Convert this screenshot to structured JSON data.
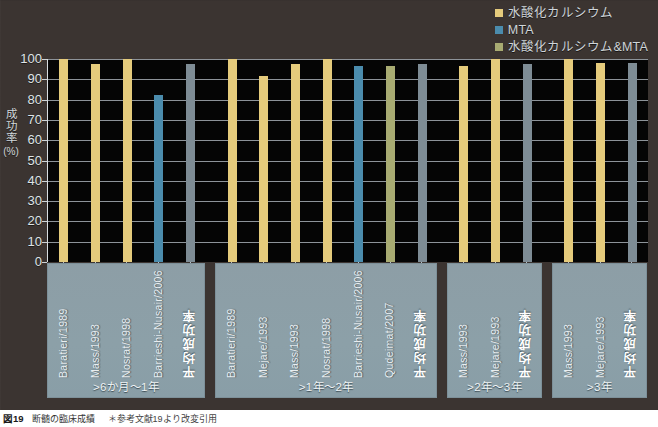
{
  "chart_data": {
    "type": "bar",
    "title": "",
    "xlabel": "",
    "ylabel": "成功率",
    "yunit": "(%)",
    "ylim": [
      0,
      100
    ],
    "yticks": [
      0,
      10,
      20,
      30,
      40,
      50,
      60,
      70,
      80,
      90,
      100
    ],
    "grid": true,
    "legend_position": "top-right",
    "legend": [
      {
        "label": "水酸化カルシウム",
        "color": "#e5cb7c",
        "key": "ca"
      },
      {
        "label": "MTA",
        "color": "#4b8cad",
        "key": "mta"
      },
      {
        "label": "水酸化カルシウム&MTA",
        "color": "#a8ab72",
        "key": "both"
      }
    ],
    "average_color": "#7e8c95",
    "groups": [
      {
        "header": ">6か月〜1年",
        "categories": [
          "Baratieri/1989",
          "Mass/1993",
          "Nosrat/1998",
          "Barrieshi-Nusair/2006",
          "平均成功率"
        ],
        "values": [
          100,
          97.5,
          100,
          82.5,
          97.5
        ],
        "series": [
          "ca",
          "ca",
          "ca",
          "mta",
          "avg"
        ]
      },
      {
        "header": ">1年〜2年",
        "categories": [
          "Baratieri/1989",
          "Mejare/1993",
          "Mass/1993",
          "Nosrat/1998",
          "Barrieshi-Nusair/2006",
          "Qudeimat/2007",
          "平均成功率"
        ],
        "values": [
          100,
          91.5,
          97.5,
          100,
          96.5,
          96.5,
          97.5
        ],
        "series": [
          "ca",
          "ca",
          "ca",
          "ca",
          "mta",
          "both",
          "avg"
        ]
      },
      {
        "header": ">2年〜3年",
        "categories": [
          "Mass/1993",
          "Mejare/1993",
          "平均成功率"
        ],
        "values": [
          96.5,
          100,
          97.5
        ],
        "series": [
          "ca",
          "ca",
          "avg"
        ]
      },
      {
        "header": ">3年",
        "categories": [
          "Mass/1993",
          "Mejare/1993",
          "平均成功率"
        ],
        "values": [
          100,
          98,
          98
        ],
        "series": [
          "ca",
          "ca",
          "avg"
        ]
      }
    ]
  },
  "caption": {
    "figure_number": "図19",
    "text": "断髄の臨床成績",
    "note": "＊参考文献19より改変引用"
  }
}
